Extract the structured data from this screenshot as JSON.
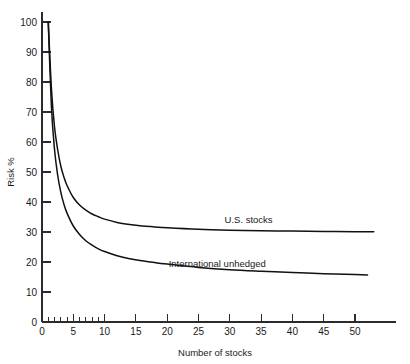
{
  "chart_data": {
    "type": "line",
    "title": "",
    "xlabel": "Number of stocks",
    "ylabel": "Risk %",
    "xlim": [
      0,
      55
    ],
    "ylim": [
      0,
      104
    ],
    "grid": false,
    "legend_position": "inline-right",
    "xticks": [
      0,
      5,
      10,
      15,
      20,
      25,
      30,
      35,
      40,
      45,
      50
    ],
    "xticklabels": [
      "0",
      "5",
      "10",
      "15",
      "20",
      "25",
      "30",
      "35",
      "40",
      "45",
      "50"
    ],
    "xminorticks": [
      1,
      2,
      3,
      4,
      6,
      7,
      8,
      9
    ],
    "yticks": [
      0,
      10,
      20,
      30,
      40,
      50,
      60,
      70,
      80,
      90,
      100
    ],
    "yticklabels": [
      "0",
      "10",
      "20",
      "30",
      "40",
      "50",
      "60",
      "70",
      "80",
      "90",
      "100"
    ],
    "series": [
      {
        "name": "U.S. stocks",
        "asymptote": 30,
        "start_value": 100,
        "x": [
          1,
          1.5,
          2,
          2.5,
          3,
          3.5,
          4,
          5,
          6,
          7,
          8,
          9,
          10,
          12,
          14,
          16,
          18,
          20,
          25,
          30,
          35,
          40,
          45,
          50,
          53
        ],
        "y": [
          100,
          78,
          65,
          57.5,
          52,
          48.3,
          45.5,
          41.5,
          39,
          37.3,
          36,
          35.1,
          34.3,
          33.2,
          32.5,
          32.0,
          31.7,
          31.4,
          30.9,
          30.6,
          30.4,
          30.3,
          30.2,
          30.1,
          30.1
        ]
      },
      {
        "name": "International unhedged",
        "asymptote": 15,
        "start_value": 100,
        "x": [
          1,
          1.5,
          2,
          2.5,
          3,
          3.5,
          4,
          5,
          6,
          7,
          8,
          9,
          10,
          12,
          14,
          16,
          18,
          20,
          25,
          30,
          35,
          40,
          45,
          50,
          52
        ],
        "y": [
          100,
          72,
          57.5,
          49,
          43.3,
          39.3,
          36.3,
          32.0,
          29.2,
          27.1,
          25.6,
          24.4,
          23.5,
          22.1,
          21.1,
          20.4,
          19.8,
          19.3,
          18.2,
          17.4,
          16.9,
          16.5,
          16.1,
          15.8,
          15.7
        ]
      }
    ],
    "annotations": [
      {
        "text": "U.S. stocks",
        "x": 33,
        "y": 33
      },
      {
        "text": "International unhedged",
        "x": 28,
        "y": 18.5
      }
    ]
  },
  "axis": {
    "x_title": "Number of stocks",
    "y_title": "Risk %"
  }
}
